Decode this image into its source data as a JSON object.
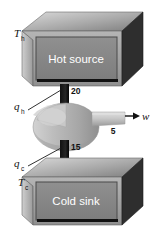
{
  "diagram": {
    "background_color": "#ffffff",
    "hot_source": {
      "label": "Hot source",
      "temperature_label": "T",
      "temperature_subscript": "h",
      "panel_color": "#8a8a8a",
      "text_color": "#ffffff"
    },
    "cold_sink": {
      "label": "Cold sink",
      "temperature_label": "T",
      "temperature_subscript": "c",
      "panel_color": "#8a8a8a",
      "text_color": "#ffffff"
    },
    "heat_in": {
      "symbol": "q",
      "subscript": "h",
      "value": "20"
    },
    "heat_out": {
      "symbol": "q",
      "subscript": "c",
      "value": "15"
    },
    "work": {
      "symbol": "w",
      "value": "5",
      "arrow": "right-arrow-icon"
    },
    "engine": {
      "name": "engine-body",
      "body_color": "#b9b9b9",
      "shaft_color": "#c6c6c6"
    },
    "conduit": {
      "name": "heat-conduit",
      "color": "#1a1a1a"
    }
  }
}
